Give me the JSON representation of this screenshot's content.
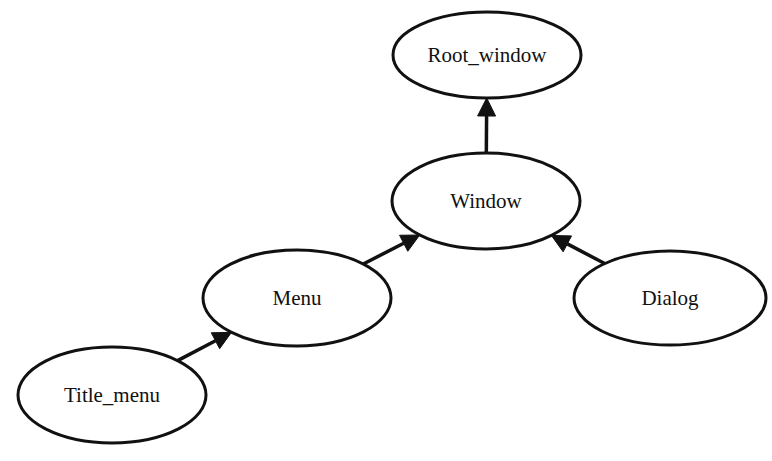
{
  "diagram": {
    "type": "directed-graph",
    "colors": {
      "stroke": "#111111",
      "fill": "#ffffff",
      "background": "#ffffff"
    },
    "nodes": [
      {
        "id": "root_window",
        "label": "Root_window",
        "cx": 487,
        "cy": 55,
        "rx": 94,
        "ry": 43
      },
      {
        "id": "window",
        "label": "Window",
        "cx": 486,
        "cy": 201,
        "rx": 94,
        "ry": 48
      },
      {
        "id": "menu",
        "label": "Menu",
        "cx": 297,
        "cy": 298,
        "rx": 94,
        "ry": 48
      },
      {
        "id": "dialog",
        "label": "Dialog",
        "cx": 670,
        "cy": 298,
        "rx": 96,
        "ry": 47
      },
      {
        "id": "title_menu",
        "label": "Title_menu",
        "cx": 112,
        "cy": 395,
        "rx": 94,
        "ry": 48
      }
    ],
    "edges": [
      {
        "from": "window",
        "to": "root_window"
      },
      {
        "from": "menu",
        "to": "window"
      },
      {
        "from": "dialog",
        "to": "window"
      },
      {
        "from": "title_menu",
        "to": "menu"
      }
    ]
  }
}
